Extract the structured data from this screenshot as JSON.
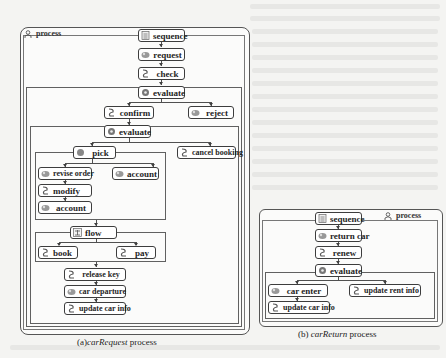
{
  "diagram_a": {
    "frame_title": "process",
    "caption_prefix": "(a)",
    "caption_italic": "carRequest",
    "caption_suffix": " process",
    "nodes": {
      "sequence": "sequence",
      "request": "request",
      "check": "check",
      "evaluate1": "evaluate",
      "confirm": "confirm",
      "reject": "reject",
      "evaluate2": "evaluate",
      "pick": "pick",
      "cancel_booking": "cancel booking",
      "revise_order": "revise order",
      "account1": "account",
      "modify": "modify",
      "account2": "account",
      "flow": "flow",
      "book": "book",
      "pay": "pay",
      "release_key": "release key",
      "car_departure": "car departure",
      "update_car_info": "update car info"
    }
  },
  "diagram_b": {
    "frame_title": "process",
    "caption_prefix": "(b) ",
    "caption_italic": "carReturn",
    "caption_suffix": " process",
    "nodes": {
      "sequence": "sequence",
      "return_car": "return car",
      "renew": "renew",
      "evaluate": "evaluate",
      "car_enter": "car enter",
      "update_rent_info": "update rent info",
      "update_car_info": "update car info"
    }
  },
  "icons": {
    "sequence": "sequence-icon",
    "service": "service-icon",
    "decision": "evaluate-icon",
    "flow": "flow-icon",
    "process": "process-icon"
  }
}
